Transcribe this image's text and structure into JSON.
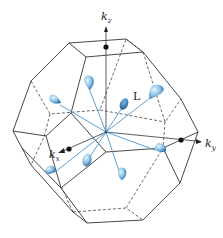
{
  "figure": {
    "labels": {
      "kz_main": "k",
      "kz_sub": "z",
      "ky_main": "k",
      "ky_sub": "y",
      "kx_main": "k",
      "kx_sub": "x",
      "L": "L"
    },
    "colors": {
      "edge": "#333333",
      "ray": "#4d94c8",
      "pocket_light": "#c9e3f5",
      "pocket_dark": "#3d7fb8"
    },
    "center": [
      106,
      132
    ],
    "pocket_count": 8
  }
}
